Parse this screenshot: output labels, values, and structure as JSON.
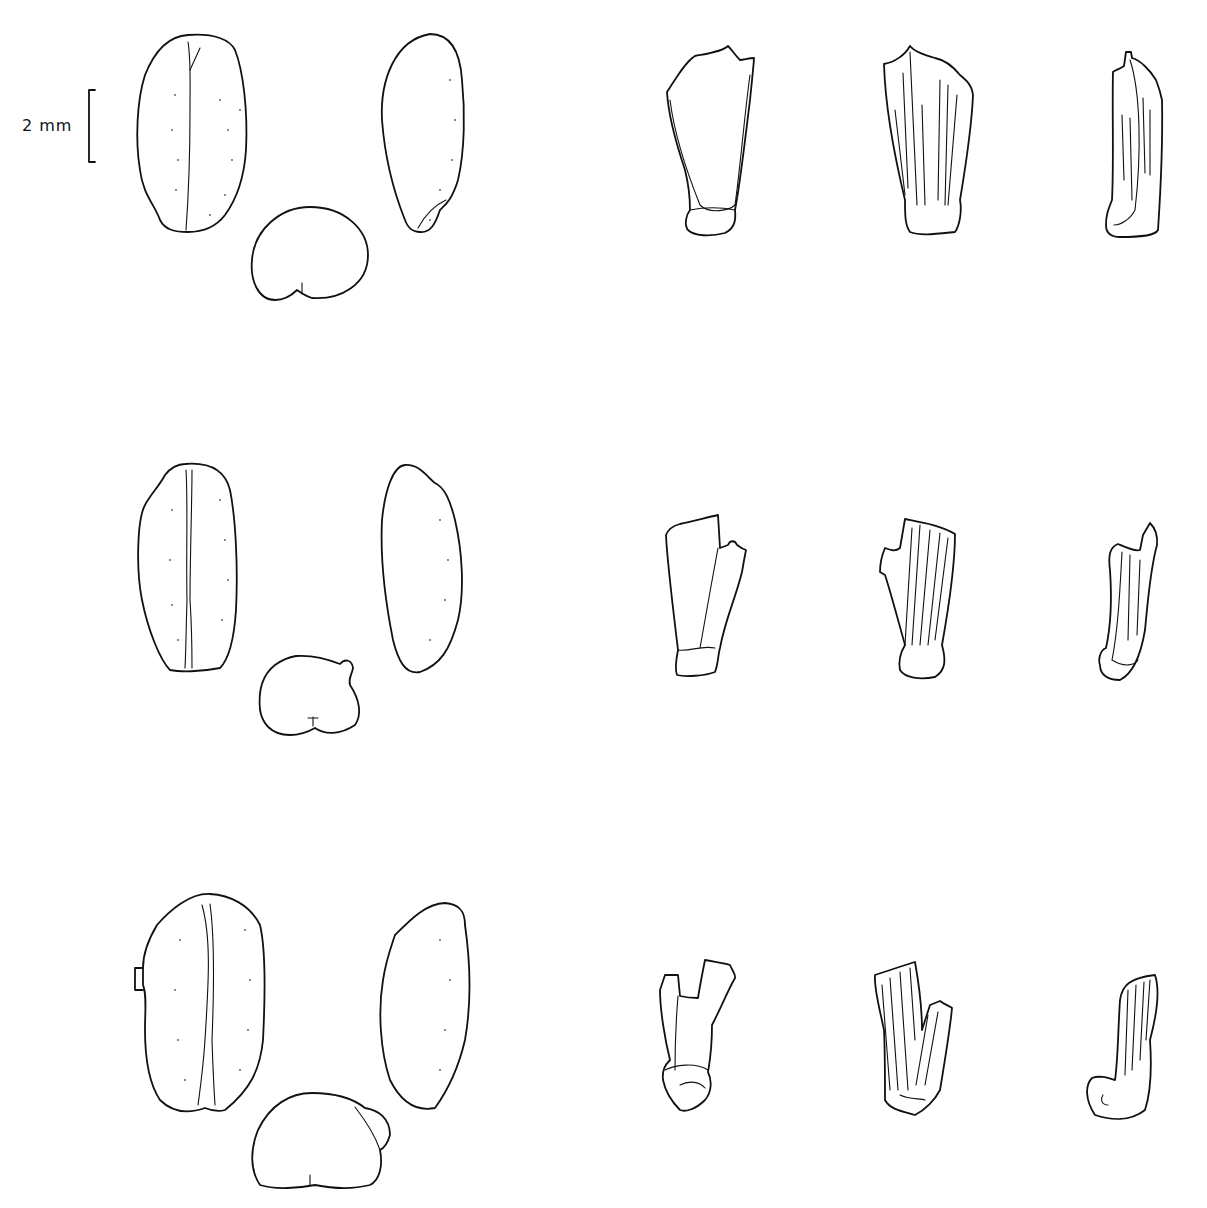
{
  "figure": {
    "type": "botanical line drawing plate",
    "background": "#ffffff",
    "ink_color": "#111111",
    "scale_bar": {
      "label": "2 mm",
      "length_px": 72
    },
    "rows": [
      {
        "index": 1,
        "grains": [
          "grain-ventral-view",
          "grain-lateral-view",
          "grain-cross-section"
        ],
        "spikelet_parts": [
          "spikelet-fork-front",
          "spikelet-fork-back",
          "spikelet-fork-side"
        ]
      },
      {
        "index": 2,
        "grains": [
          "grain-ventral-view",
          "grain-lateral-view",
          "grain-cross-section"
        ],
        "spikelet_parts": [
          "spikelet-fork-front",
          "spikelet-fork-back",
          "spikelet-fork-side"
        ]
      },
      {
        "index": 3,
        "grains": [
          "grain-ventral-view",
          "grain-lateral-view",
          "grain-cross-section"
        ],
        "spikelet_parts": [
          "spikelet-fork-front",
          "spikelet-fork-back",
          "spikelet-fork-side"
        ]
      }
    ]
  }
}
